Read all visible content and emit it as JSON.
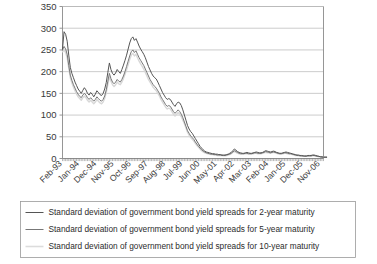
{
  "chart_data": {
    "type": "line",
    "title": "",
    "subtitle": "",
    "xlabel": "",
    "ylabel": "",
    "ylim": [
      0,
      350
    ],
    "yticks": [
      0,
      50,
      100,
      150,
      200,
      250,
      300,
      350
    ],
    "ytick_labels": [
      "0",
      "50",
      "100",
      "150",
      "200",
      "250",
      "300",
      "350"
    ],
    "grid": true,
    "legend_position": "bottom",
    "xtick_labels": [
      "Feb-93",
      "Jan-94",
      "Dec-94",
      "Nov-95",
      "Oct-96",
      "Sep-97",
      "Aug-98",
      "Jul-99",
      "Jun-00",
      "May-01",
      "Apr-02",
      "Mar-03",
      "Feb-04",
      "Jan-05",
      "Dec-05",
      "Nov-06"
    ],
    "xtick_indices": [
      0,
      11,
      22,
      33,
      44,
      55,
      66,
      77,
      88,
      99,
      110,
      121,
      132,
      143,
      154,
      165
    ],
    "x_count": 168,
    "series": [
      {
        "name": "Standard deviation of government bond yield spreads for 2-year maturity",
        "color": "#555555",
        "width": 1.0,
        "values": [
          252,
          292,
          286,
          270,
          238,
          210,
          196,
          186,
          176,
          168,
          160,
          155,
          150,
          157,
          163,
          158,
          150,
          146,
          152,
          148,
          142,
          148,
          156,
          152,
          147,
          145,
          150,
          160,
          175,
          198,
          220,
          205,
          196,
          192,
          197,
          205,
          200,
          196,
          205,
          215,
          226,
          238,
          252,
          266,
          276,
          280,
          272,
          276,
          268,
          259,
          252,
          246,
          240,
          232,
          222,
          212,
          204,
          196,
          190,
          186,
          183,
          176,
          168,
          160,
          152,
          146,
          140,
          136,
          138,
          136,
          130,
          124,
          120,
          126,
          130,
          128,
          122,
          112,
          100,
          88,
          76,
          68,
          62,
          58,
          52,
          46,
          40,
          34,
          28,
          24,
          20,
          17,
          15,
          14,
          13,
          12,
          11,
          11,
          10,
          10,
          9,
          9,
          8,
          8,
          8,
          9,
          10,
          12,
          14,
          18,
          22,
          19,
          16,
          14,
          13,
          12,
          12,
          13,
          14,
          13,
          12,
          12,
          13,
          14,
          15,
          14,
          13,
          13,
          14,
          16,
          18,
          17,
          16,
          15,
          16,
          17,
          16,
          14,
          13,
          12,
          12,
          13,
          14,
          15,
          14,
          13,
          12,
          11,
          10,
          9,
          8,
          8,
          7,
          7,
          6,
          6,
          6,
          7,
          7,
          7,
          8,
          8,
          7,
          6,
          5,
          4,
          4,
          3,
          3,
          3
        ]
      },
      {
        "name": "Standard deviation of government bond yield spreads for 5-year maturity",
        "color": "#777777",
        "width": 1.0,
        "values": [
          250,
          258,
          252,
          240,
          214,
          192,
          180,
          170,
          162,
          154,
          148,
          143,
          140,
          146,
          150,
          146,
          140,
          136,
          140,
          136,
          132,
          136,
          142,
          138,
          134,
          132,
          136,
          144,
          158,
          178,
          196,
          184,
          176,
          172,
          176,
          182,
          178,
          176,
          182,
          190,
          200,
          212,
          224,
          236,
          246,
          250,
          244,
          248,
          240,
          232,
          226,
          220,
          214,
          206,
          198,
          190,
          182,
          176,
          170,
          166,
          162,
          156,
          150,
          142,
          136,
          130,
          124,
          120,
          122,
          120,
          114,
          108,
          104,
          108,
          112,
          108,
          102,
          94,
          84,
          74,
          64,
          58,
          52,
          48,
          44,
          38,
          33,
          28,
          24,
          20,
          17,
          15,
          13,
          12,
          11,
          10,
          10,
          9,
          9,
          8,
          8,
          8,
          7,
          7,
          7,
          8,
          9,
          10,
          12,
          15,
          18,
          16,
          14,
          12,
          11,
          11,
          11,
          12,
          12,
          11,
          11,
          11,
          12,
          13,
          13,
          12,
          12,
          12,
          13,
          14,
          16,
          15,
          14,
          13,
          14,
          15,
          14,
          13,
          12,
          11,
          11,
          12,
          13,
          13,
          12,
          11,
          11,
          10,
          9,
          8,
          7,
          7,
          6,
          6,
          6,
          5,
          5,
          6,
          6,
          6,
          7,
          7,
          6,
          5,
          5,
          4,
          3,
          3,
          3,
          3
        ]
      },
      {
        "name": "Standard deviation of government bond yield spreads for 10-year maturity",
        "color": "#d8d8d8",
        "width": 1.4,
        "values": [
          246,
          250,
          244,
          232,
          208,
          186,
          174,
          164,
          156,
          148,
          142,
          138,
          134,
          140,
          144,
          140,
          134,
          130,
          134,
          130,
          126,
          130,
          136,
          132,
          128,
          126,
          130,
          138,
          152,
          170,
          188,
          178,
          170,
          166,
          170,
          176,
          172,
          170,
          176,
          184,
          194,
          204,
          216,
          228,
          238,
          242,
          236,
          240,
          232,
          224,
          218,
          212,
          206,
          198,
          190,
          182,
          176,
          170,
          164,
          160,
          156,
          150,
          144,
          136,
          130,
          124,
          118,
          114,
          116,
          114,
          108,
          102,
          98,
          102,
          106,
          102,
          96,
          88,
          80,
          70,
          60,
          54,
          48,
          44,
          40,
          35,
          30,
          26,
          22,
          18,
          15,
          13,
          12,
          11,
          10,
          9,
          9,
          8,
          8,
          7,
          7,
          7,
          7,
          6,
          6,
          7,
          8,
          9,
          11,
          14,
          16,
          14,
          12,
          11,
          10,
          10,
          10,
          11,
          11,
          10,
          10,
          10,
          11,
          12,
          12,
          11,
          11,
          11,
          12,
          13,
          14,
          13,
          13,
          12,
          13,
          14,
          13,
          12,
          11,
          10,
          10,
          11,
          12,
          12,
          11,
          10,
          10,
          9,
          8,
          7,
          7,
          6,
          6,
          5,
          5,
          5,
          5,
          5,
          5,
          5,
          6,
          6,
          5,
          5,
          4,
          3,
          3,
          3,
          3,
          3
        ]
      }
    ]
  },
  "legend": {
    "items": [
      {
        "label": "Standard deviation of government bond yield spreads for 2-year maturity",
        "color": "#555555"
      },
      {
        "label": "Standard deviation of government bond yield spreads for 5-year maturity",
        "color": "#777777"
      },
      {
        "label": "Standard deviation of government bond yield spreads for 10-year maturity",
        "color": "#dcdcdc"
      }
    ]
  },
  "colors": {
    "background": "#ffffff",
    "gridline": "#b5b5b5",
    "axis": "#8a8a8a",
    "text": "#3a3a3a"
  }
}
